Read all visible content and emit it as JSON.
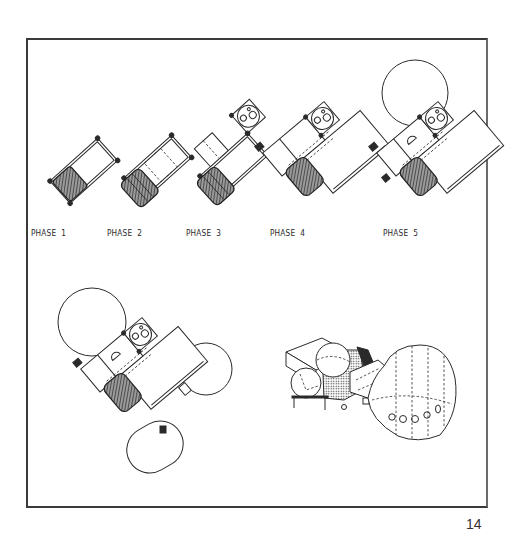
{
  "figure": {
    "phases": [
      {
        "id": 1,
        "label": "PHASE  1"
      },
      {
        "id": 2,
        "label": "PHASE  2"
      },
      {
        "id": 3,
        "label": "PHASE  3"
      },
      {
        "id": 4,
        "label": "PHASE  4"
      },
      {
        "id": 5,
        "label": "PHASE  5"
      }
    ],
    "views": [
      {
        "name": "final-configuration-plan",
        "description": "Plan view of complete assembly with two spheres and capsule module"
      },
      {
        "name": "final-configuration-isometric",
        "description": "Isometric view of complete assembly with inflatable dome and portholes"
      }
    ]
  },
  "page": {
    "number": "14"
  },
  "colors": {
    "ink": "#2b2b2b",
    "paper": "#ffffff"
  }
}
